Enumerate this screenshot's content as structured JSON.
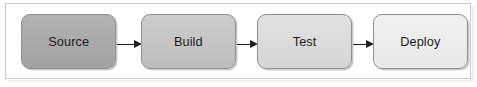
{
  "diagram": {
    "type": "flowchart",
    "orientation": "horizontal",
    "title": "",
    "frame": {
      "border_color": "#c9c9c9",
      "background_color": "#ffffff"
    },
    "nodes": [
      {
        "id": "source",
        "label": "Source",
        "shape": "rounded-rectangle",
        "fill_top": "#b2b2b2",
        "fill_bottom": "#a2a2a2",
        "border_color": "#8f8f8f",
        "text_color": "#1b1b1b"
      },
      {
        "id": "build",
        "label": "Build",
        "shape": "rounded-rectangle",
        "fill_top": "#cdcdcd",
        "fill_bottom": "#bdbdbd",
        "border_color": "#8f8f8f",
        "text_color": "#1b1b1b"
      },
      {
        "id": "test",
        "label": "Test",
        "shape": "rounded-rectangle",
        "fill_top": "#e2e2e2",
        "fill_bottom": "#d5d5d5",
        "border_color": "#8f8f8f",
        "text_color": "#1b1b1b"
      },
      {
        "id": "deploy",
        "label": "Deploy",
        "shape": "rounded-rectangle",
        "fill_top": "#f1f1f1",
        "fill_bottom": "#e8e8e8",
        "border_color": "#8f8f8f",
        "text_color": "#1b1b1b"
      }
    ],
    "edges": [
      {
        "id": "source-to-build",
        "from": "source",
        "to": "build",
        "label": "",
        "style": "solid-arrow",
        "color": "#1f1f1f"
      },
      {
        "id": "build-to-test",
        "from": "build",
        "to": "test",
        "label": "",
        "style": "solid-arrow",
        "color": "#1f1f1f"
      },
      {
        "id": "test-to-deploy",
        "from": "test",
        "to": "deploy",
        "label": "",
        "style": "solid-arrow",
        "color": "#1f1f1f"
      }
    ]
  }
}
